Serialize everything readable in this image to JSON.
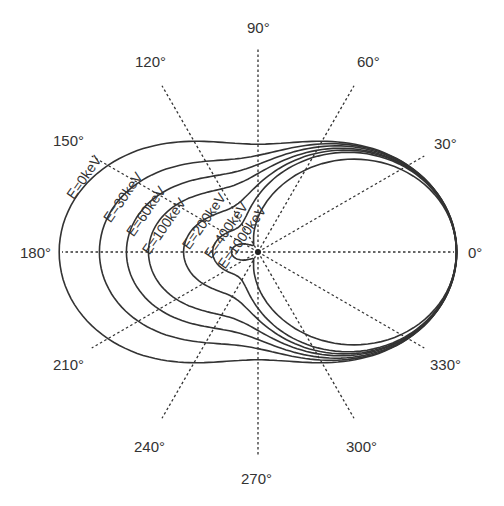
{
  "chart_data": {
    "type": "polar",
    "title": "",
    "center_px": [
      258,
      252
    ],
    "angle_ticks": [
      {
        "deg": 0,
        "label": "0°",
        "x": 468,
        "y": 258,
        "anchor": "start",
        "spoke_from": 0,
        "spoke_to": 196
      },
      {
        "deg": 30,
        "label": "30°",
        "x": 434,
        "y": 149,
        "anchor": "start",
        "spoke_from": 0,
        "spoke_to": 192
      },
      {
        "deg": 60,
        "label": "60°",
        "x": 357,
        "y": 67,
        "anchor": "start",
        "spoke_from": 0,
        "spoke_to": 192
      },
      {
        "deg": 90,
        "label": "90°",
        "x": 247,
        "y": 33,
        "anchor": "start",
        "spoke_from": 0,
        "spoke_to": 203
      },
      {
        "deg": 120,
        "label": "120°",
        "x": 135,
        "y": 67,
        "anchor": "start",
        "spoke_from": 0,
        "spoke_to": 192
      },
      {
        "deg": 150,
        "label": "150°",
        "x": 53,
        "y": 146,
        "anchor": "start",
        "spoke_from": 0,
        "spoke_to": 192
      },
      {
        "deg": 180,
        "label": "180°",
        "x": 20,
        "y": 258,
        "anchor": "start",
        "spoke_from": 0,
        "spoke_to": 196
      },
      {
        "deg": 210,
        "label": "210°",
        "x": 53,
        "y": 370,
        "anchor": "start",
        "spoke_from": 0,
        "spoke_to": 192
      },
      {
        "deg": 240,
        "label": "240°",
        "x": 134,
        "y": 452,
        "anchor": "start",
        "spoke_from": 0,
        "spoke_to": 192
      },
      {
        "deg": 270,
        "label": "270°",
        "x": 241,
        "y": 484,
        "anchor": "start",
        "spoke_from": 0,
        "spoke_to": 203
      },
      {
        "deg": 300,
        "label": "300°",
        "x": 346,
        "y": 452,
        "anchor": "start",
        "spoke_from": 0,
        "spoke_to": 192
      },
      {
        "deg": 330,
        "label": "330°",
        "x": 430,
        "y": 370,
        "anchor": "start",
        "spoke_from": 0,
        "spoke_to": 192
      }
    ],
    "series": [
      {
        "name": "E=0keV",
        "label": "E=0keV",
        "r_0": 197,
        "r_90": 106,
        "r_180": 197,
        "label_x": 88,
        "label_y": 180
      },
      {
        "name": "E=30keV",
        "label": "E=30keV",
        "r_0": 197,
        "r_90": 95,
        "r_180": 157,
        "label_x": 127,
        "label_y": 200
      },
      {
        "name": "E=60keV",
        "label": "E=60keV",
        "r_0": 197,
        "r_90": 86,
        "r_180": 130,
        "label_x": 150,
        "label_y": 214
      },
      {
        "name": "E=100keV",
        "label": "E=100keV",
        "r_0": 197,
        "r_90": 77,
        "r_180": 108,
        "label_x": 168,
        "label_y": 229
      },
      {
        "name": "E=200keV",
        "label": "E=200keV",
        "r_0": 197,
        "r_90": 66,
        "r_180": 73,
        "label_x": 208,
        "label_y": 224
      },
      {
        "name": "E=400keV",
        "label": "E=400keV",
        "r_0": 197,
        "r_90": 55,
        "r_180": 44,
        "label_x": 230,
        "label_y": 233
      },
      {
        "name": "E=1000keV",
        "label": "E=1000keV",
        "r_0": 197,
        "r_90": 33,
        "r_180": 25,
        "label_x": 246,
        "label_y": 240
      }
    ],
    "label_rotation_deg": -55,
    "relative_intensity_at_angle": {
      "note": "radius relative to 0° value",
      "E=0keV": {
        "0": 1.0,
        "90": 0.54,
        "180": 1.0
      },
      "E=30keV": {
        "0": 1.0,
        "90": 0.48,
        "180": 0.8
      },
      "E=60keV": {
        "0": 1.0,
        "90": 0.44,
        "180": 0.66
      },
      "E=100keV": {
        "0": 1.0,
        "90": 0.39,
        "180": 0.55
      },
      "E=200keV": {
        "0": 1.0,
        "90": 0.34,
        "180": 0.37
      },
      "E=400keV": {
        "0": 1.0,
        "90": 0.28,
        "180": 0.22
      },
      "E=1000keV": {
        "0": 1.0,
        "90": 0.17,
        "180": 0.13
      }
    },
    "grid": false,
    "legend": "inline labels along curves"
  }
}
